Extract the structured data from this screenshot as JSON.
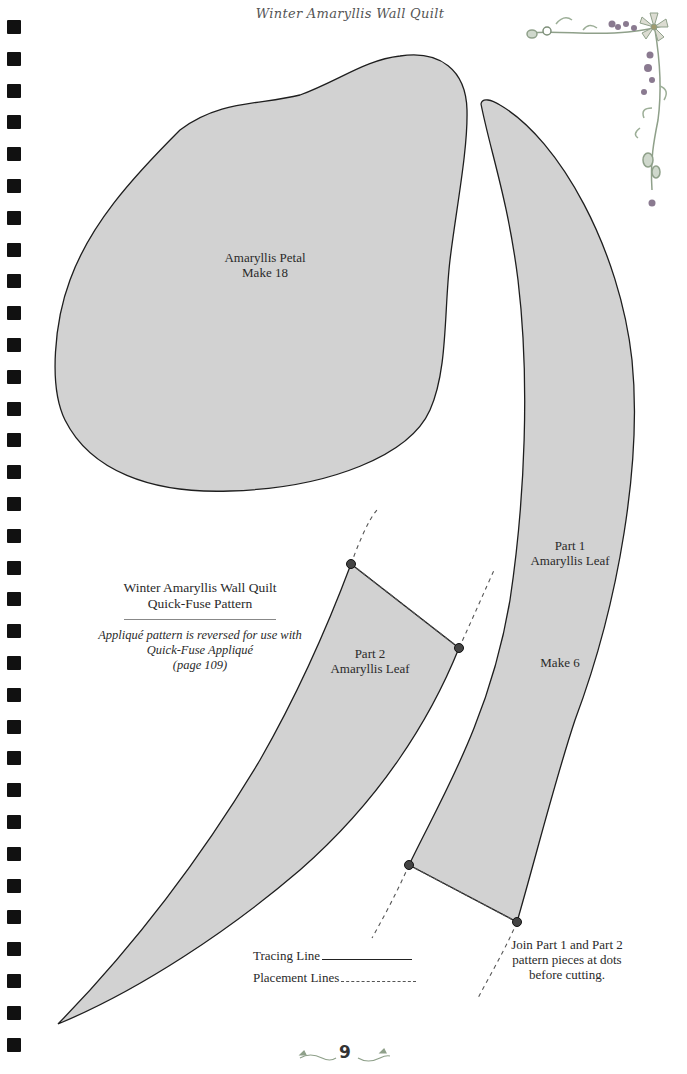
{
  "page": {
    "running_head": "Winter Amaryllis Wall Quilt",
    "page_number": "9",
    "binding_hole_count": 33
  },
  "pieces": {
    "petal": {
      "name": "Amaryllis Petal",
      "quantity": "Make 18"
    },
    "leaf_part1": {
      "part": "Part 1",
      "name": "Amaryllis Leaf",
      "quantity": "Make 6"
    },
    "leaf_part2": {
      "part": "Part 2",
      "name": "Amaryllis Leaf"
    }
  },
  "caption": {
    "title_line1": "Winter Amaryllis Wall Quilt",
    "title_line2": "Quick-Fuse Pattern",
    "note_line1": "Appliqué pattern is reversed for use with",
    "note_line2": "Quick-Fuse Appliqué",
    "note_line3": "(page 109)"
  },
  "legend": {
    "tracing": "Tracing Line",
    "placement": "Placement Lines"
  },
  "join_note": {
    "line1": "Join Part 1 and Part 2",
    "line2": "pattern pieces at dots",
    "line3": "before cutting."
  },
  "colors": {
    "piece_fill": "#d2d2d2",
    "outline": "#1e1e1e",
    "dot": "#444444",
    "decor_green": "#8fa08a",
    "decor_berry": "#7a6a80"
  },
  "icons": {
    "corner_decoration": "floral-vine-corner",
    "folio_ornament_left": "leaf-swirl",
    "folio_ornament_right": "leaf-swirl"
  }
}
